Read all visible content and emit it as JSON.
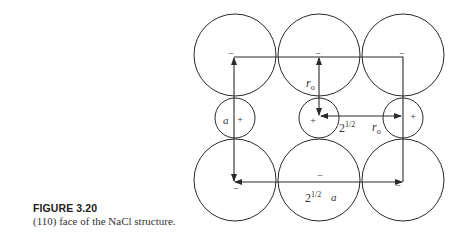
{
  "caption": {
    "label": "FIGURE 3.20",
    "text": "(110) face of the NaCl structure."
  },
  "diagram": {
    "anion_sign": "−",
    "cation_sign": "+",
    "labels": {
      "edge_a": "a",
      "radius_top": "r",
      "radius_top_sub": "o",
      "diag_ro_coef": "2",
      "diag_ro_exp": "1/2",
      "diag_ro_var": "r",
      "diag_ro_sub": "o",
      "diag_a_coef": "2",
      "diag_a_exp": "1/2",
      "diag_a_var": "a"
    },
    "ions": [
      {
        "kind": "anion",
        "row": 0,
        "col": 0
      },
      {
        "kind": "anion",
        "row": 0,
        "col": 1
      },
      {
        "kind": "anion",
        "row": 0,
        "col": 2
      },
      {
        "kind": "cation",
        "row": 1,
        "col": 0
      },
      {
        "kind": "cation",
        "row": 1,
        "col": 1
      },
      {
        "kind": "cation",
        "row": 1,
        "col": 2
      },
      {
        "kind": "anion",
        "row": 2,
        "col": 0
      },
      {
        "kind": "anion",
        "row": 2,
        "col": 1
      },
      {
        "kind": "anion",
        "row": 2,
        "col": 2
      }
    ]
  },
  "colors": {
    "stroke": "#2a2a2a",
    "text": "#333333"
  }
}
